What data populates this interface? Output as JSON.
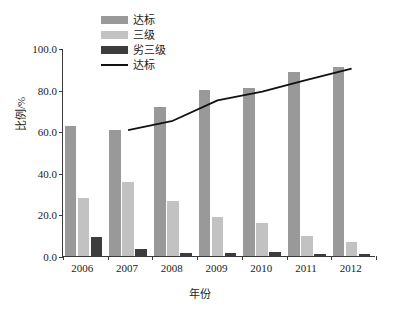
{
  "chart_data": {
    "type": "bar",
    "title": "",
    "xlabel": "年份",
    "ylabel": "比例/%",
    "categories": [
      "2006",
      "2007",
      "2008",
      "2009",
      "2010",
      "2011",
      "2012"
    ],
    "ylim": [
      0,
      100
    ],
    "yticks": [
      "0.0",
      "20.0",
      "40.0",
      "60.0",
      "80.0",
      "100.0"
    ],
    "ytick_values": [
      0,
      20,
      40,
      60,
      80,
      100
    ],
    "grid": false,
    "legend_position": "top-center",
    "series": [
      {
        "name": "达标",
        "kind": "bar",
        "color": "#999999",
        "values": [
          62.3,
          60.6,
          71.6,
          79.6,
          81.0,
          88.6,
          91.0
        ]
      },
      {
        "name": "三级",
        "kind": "bar",
        "color": "#c2c2c2",
        "values": [
          28.0,
          35.8,
          26.4,
          18.6,
          16.1,
          9.5,
          6.8
        ]
      },
      {
        "name": "劣三级",
        "kind": "bar",
        "color": "#3d3d3d",
        "values": [
          9.1,
          3.3,
          1.4,
          1.5,
          1.7,
          1.0,
          1.1
        ]
      },
      {
        "name": "达标",
        "kind": "line",
        "color": "#111111",
        "values": [
          null,
          61.0,
          65.5,
          75.3,
          79.5,
          85.2,
          90.6
        ]
      }
    ]
  },
  "legend": {
    "items": [
      {
        "label": "达标",
        "marker": "swatch",
        "color": "#999999"
      },
      {
        "label": "三级",
        "marker": "swatch",
        "color": "#c2c2c2"
      },
      {
        "label": "劣三级",
        "marker": "swatch",
        "color": "#3d3d3d"
      },
      {
        "label": "达标",
        "marker": "line",
        "color": "#111111"
      }
    ]
  }
}
